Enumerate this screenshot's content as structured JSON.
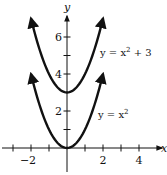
{
  "chart_data": {
    "type": "line",
    "title": "",
    "xlabel": "x",
    "ylabel": "y",
    "xlim": [
      -3,
      5
    ],
    "ylim": [
      -1,
      7
    ],
    "x_ticks": [
      -3,
      -2,
      -1,
      1,
      2,
      3,
      4
    ],
    "x_tick_labels": [
      {
        "value": -2,
        "text": "−2"
      },
      {
        "value": 2,
        "text": "2"
      },
      {
        "value": 4,
        "text": "4"
      }
    ],
    "y_ticks": [
      1,
      2,
      3,
      4,
      5,
      6
    ],
    "y_tick_labels": [
      {
        "value": 2,
        "text": "2"
      },
      {
        "value": 4,
        "text": "4"
      },
      {
        "value": 6,
        "text": "6"
      }
    ],
    "grid": false,
    "series": [
      {
        "name": "y = x^2",
        "label_main": "y = x",
        "label_sup": "2",
        "label_tail": "",
        "shift": 0,
        "x_range": [
          -2,
          2
        ]
      },
      {
        "name": "y = x^2 + 3",
        "label_main": "y = x",
        "label_sup": "2",
        "label_tail": " + 3",
        "shift": 3,
        "x_range": [
          -2,
          2
        ]
      }
    ]
  }
}
